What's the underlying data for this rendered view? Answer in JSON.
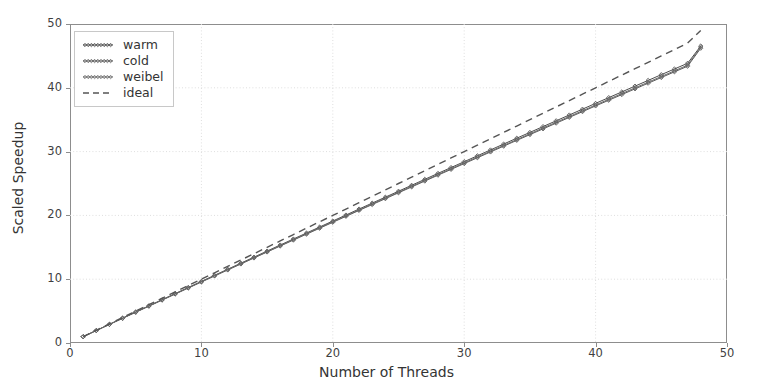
{
  "chart_data": {
    "type": "line",
    "title": "",
    "xlabel": "Number of Threads",
    "ylabel": "Scaled Speedup",
    "xlim": [
      0,
      50
    ],
    "ylim": [
      0,
      50
    ],
    "xticks": [
      0,
      10,
      20,
      30,
      40,
      50
    ],
    "yticks": [
      0,
      10,
      20,
      30,
      40,
      50
    ],
    "grid": true,
    "legend_position": "upper left",
    "x": [
      1,
      2,
      3,
      4,
      5,
      6,
      7,
      8,
      9,
      10,
      11,
      12,
      13,
      14,
      15,
      16,
      17,
      18,
      19,
      20,
      21,
      22,
      23,
      24,
      25,
      26,
      27,
      28,
      29,
      30,
      31,
      32,
      33,
      34,
      35,
      36,
      37,
      38,
      39,
      40,
      41,
      42,
      43,
      44,
      45,
      46,
      47,
      48
    ],
    "series": [
      {
        "name": "warm",
        "style": "solid-markers",
        "color": "#4d4d4d",
        "values": [
          1.0,
          1.97,
          2.94,
          3.9,
          4.86,
          5.82,
          6.78,
          7.74,
          8.7,
          9.66,
          10.61,
          11.56,
          12.51,
          13.46,
          14.41,
          15.36,
          16.3,
          17.24,
          18.18,
          19.12,
          20.06,
          21.0,
          21.93,
          22.86,
          23.79,
          24.72,
          25.65,
          26.58,
          27.5,
          28.42,
          29.34,
          30.26,
          31.18,
          32.1,
          33.01,
          33.92,
          34.83,
          35.74,
          36.65,
          37.56,
          38.46,
          39.36,
          40.26,
          41.16,
          42.06,
          42.95,
          43.84,
          46.55
        ]
      },
      {
        "name": "cold",
        "style": "solid-markers",
        "color": "#595959",
        "values": [
          0.98,
          1.94,
          2.9,
          3.86,
          4.81,
          5.76,
          6.71,
          7.66,
          8.61,
          9.56,
          10.5,
          11.44,
          12.38,
          13.32,
          14.26,
          15.2,
          16.13,
          17.06,
          17.99,
          18.92,
          19.85,
          20.78,
          21.7,
          22.62,
          23.54,
          24.46,
          25.38,
          26.3,
          27.21,
          28.12,
          29.03,
          29.94,
          30.85,
          31.76,
          32.66,
          33.56,
          34.46,
          35.36,
          36.26,
          37.16,
          38.05,
          38.94,
          39.83,
          40.72,
          41.61,
          42.5,
          43.38,
          46.2
        ]
      },
      {
        "name": "weibel",
        "style": "solid-markers",
        "color": "#6a6a6a",
        "values": [
          1.0,
          1.96,
          2.92,
          3.88,
          4.84,
          5.8,
          6.75,
          7.7,
          8.65,
          9.6,
          10.55,
          11.5,
          12.44,
          13.38,
          14.32,
          15.26,
          16.2,
          17.14,
          18.07,
          19.0,
          19.93,
          20.86,
          21.79,
          22.72,
          23.64,
          24.56,
          25.48,
          26.4,
          27.32,
          28.24,
          29.15,
          30.06,
          30.97,
          31.88,
          32.79,
          33.7,
          34.6,
          35.5,
          36.4,
          37.3,
          38.2,
          39.1,
          39.99,
          40.88,
          41.77,
          42.66,
          43.55,
          46.4
        ]
      },
      {
        "name": "ideal",
        "style": "dashed",
        "color": "#555555",
        "values": [
          1,
          2,
          3,
          4,
          5,
          6,
          7,
          8,
          9,
          10,
          11,
          12,
          13,
          14,
          15,
          16,
          17,
          18,
          19,
          20,
          21,
          22,
          23,
          24,
          25,
          26,
          27,
          28,
          29,
          30,
          31,
          32,
          33,
          34,
          35,
          36,
          37,
          38,
          39,
          40,
          41,
          42,
          43,
          44,
          45,
          46,
          47,
          49
        ]
      }
    ]
  },
  "legend": {
    "entries": [
      {
        "label": "warm"
      },
      {
        "label": "cold"
      },
      {
        "label": "weibel"
      },
      {
        "label": "ideal"
      }
    ]
  },
  "axis": {
    "xlabel": "Number of Threads",
    "ylabel": "Scaled Speedup",
    "xtick_labels": [
      "0",
      "10",
      "20",
      "30",
      "40",
      "50"
    ],
    "ytick_labels": [
      "0",
      "10",
      "20",
      "30",
      "40",
      "50"
    ]
  },
  "colors": {
    "background": "#ffffff",
    "spine": "#8d8d8d",
    "grid": "#dedede",
    "text": "#343434"
  }
}
